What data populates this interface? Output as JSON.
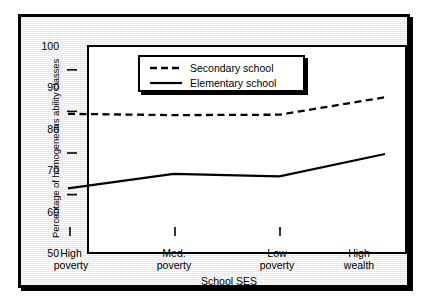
{
  "chart_data": {
    "type": "line",
    "title": "",
    "xlabel": "School SES",
    "ylabel": "Percentage of homogeneous ability classes",
    "categories": [
      "High\npoverty",
      "Med.\npoverty",
      "Low\npoverty",
      "High\nwealth"
    ],
    "category_lines": [
      [
        "High",
        "poverty"
      ],
      [
        "Med.",
        "poverty"
      ],
      [
        "Low",
        "poverty"
      ],
      [
        "High",
        "wealth"
      ]
    ],
    "ylim": [
      50,
      100
    ],
    "yticks": [
      100,
      90,
      80,
      70,
      60,
      50
    ],
    "grid": false,
    "legend_position": "top-center",
    "series": [
      {
        "name": "Secondary school",
        "style": "dashed",
        "color": "#000000",
        "values": [
          79.5,
          79.2,
          79.3,
          83.5
        ]
      },
      {
        "name": "Elementary school",
        "style": "solid",
        "color": "#000000",
        "values": [
          61.5,
          65.0,
          64.4,
          69.8
        ]
      }
    ]
  },
  "legend": {
    "items": [
      {
        "label": "Secondary school",
        "style": "dashed"
      },
      {
        "label": "Elementary school",
        "style": "solid"
      }
    ]
  },
  "axes": {
    "y_title": "Percentage of homogeneous ability classes",
    "x_title": "School SES",
    "y_tick_labels": [
      "100",
      "90",
      "80",
      "70",
      "60",
      "50"
    ]
  }
}
